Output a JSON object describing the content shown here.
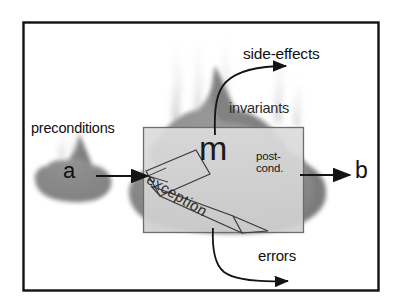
{
  "figure": {
    "frame": {
      "label": "outer-frame"
    },
    "labels": {
      "preconditions": "preconditions",
      "side_effects": "side-effects",
      "invariants": "invariants",
      "errors": "errors",
      "exception": "exception",
      "method": "m",
      "input": "a",
      "output": "b",
      "postcond_line1": "post-",
      "postcond_line2": "cond."
    },
    "colors": {
      "frame": "#111111",
      "background": "#ffffff",
      "cloud_fill": "#8f8f8f",
      "cloud_dark": "#7a7a7a",
      "box_fill": "#d5d5d5",
      "box_stroke": "#6d6d6d",
      "arrow": "#141414",
      "text": "#111111",
      "smoke": "#c8c8c8"
    }
  }
}
